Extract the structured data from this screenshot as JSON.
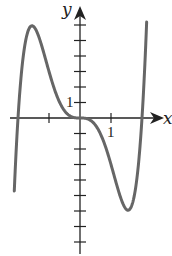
{
  "chart_data": {
    "type": "line",
    "title": "",
    "xlabel": "x",
    "ylabel": "y",
    "function_hint": "y = x^3 (x^2 - 4)",
    "x_tick_positions": [
      -2,
      -1,
      0,
      1,
      2
    ],
    "y_tick_positions": [
      -8,
      -7,
      -6,
      -5,
      -4,
      -3,
      -2,
      -1,
      0,
      1,
      2,
      3,
      4,
      5,
      6
    ],
    "labeled_ticks": {
      "x": "1",
      "y": "1"
    },
    "xlim": [
      -2.15,
      2.4
    ],
    "ylim": [
      -8.5,
      7
    ],
    "grid": false,
    "series": [
      {
        "name": "f(x)",
        "color": "#666666",
        "x": [
          -2.12,
          -2.0,
          -1.8,
          -1.58,
          -1.4,
          -1.2,
          -1.0,
          -0.8,
          -0.5,
          0.0,
          0.5,
          0.8,
          1.0,
          1.2,
          1.4,
          1.55,
          1.8,
          2.0,
          2.15
        ],
        "y": [
          -5.8,
          0.0,
          4.5,
          6.0,
          5.2,
          4.6,
          3.0,
          1.7,
          0.5,
          0.0,
          -0.5,
          -1.7,
          -3.0,
          -4.6,
          -5.2,
          -6.0,
          -4.5,
          0.0,
          5.8
        ]
      }
    ],
    "annotations": [],
    "legend": null
  },
  "labels": {
    "x_axis": "x",
    "y_axis": "y",
    "x_tick_one": "1",
    "y_tick_one": "1"
  }
}
